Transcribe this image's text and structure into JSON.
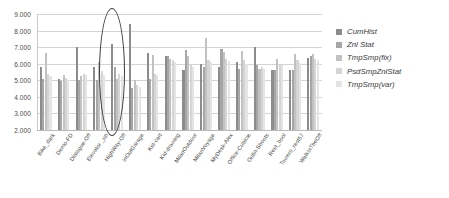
{
  "chart_data": {
    "type": "bar",
    "title": "",
    "xlabel": "",
    "ylabel": "",
    "ylim": [
      2000,
      9000
    ],
    "ytick_labels": [
      "9.000",
      "8.000",
      "7.000",
      "6.000",
      "5.000",
      "4.000",
      "3.000",
      "2.000"
    ],
    "ytick_values": [
      9000,
      8000,
      7000,
      6000,
      5000,
      4000,
      3000,
      2000
    ],
    "grid": true,
    "legend_position": "right",
    "categories": [
      "Bike_dark",
      "Demo-FD",
      "Dialogue-Off",
      "Elevator _up",
      "HighWay-Off",
      "InOutGarage",
      "Kid-cart",
      "Kid-drawing",
      "MilanOutdoor",
      "MilanVoyage",
      "MyDesk-Alex",
      "Office-Cubicle",
      "Outin-Shoots",
      "Rest_bool",
      "Towers_rest57",
      "WalkInTheOff"
    ],
    "series": [
      {
        "name": "CumHist",
        "color": "#8c8c8c",
        "values": [
          5800,
          5050,
          7000,
          5780,
          7200,
          8400,
          6620,
          6450,
          5600,
          6000,
          5800,
          6100,
          7020,
          5650,
          5620,
          6350
        ]
      },
      {
        "name": "Znl Stat",
        "color": "#a6a6a6",
        "values": [
          5050,
          4950,
          5000,
          5020,
          5780,
          4550,
          5100,
          6480,
          6850,
          5820,
          6900,
          5700,
          5950,
          5600,
          5600,
          6450
        ]
      },
      {
        "name": "TmpSmp(fix)",
        "color": "#c2c2c2",
        "values": [
          6620,
          5300,
          5250,
          6100,
          5100,
          5020,
          6550,
          6300,
          6450,
          7530,
          6700,
          6750,
          5700,
          6300,
          6600,
          6600
        ]
      },
      {
        "name": "PsdSmpZnlStat",
        "color": "#d5d5d5",
        "values": [
          5400,
          5150,
          5400,
          5550,
          5400,
          4700,
          5400,
          6200,
          5900,
          6200,
          6300,
          6200,
          5800,
          6000,
          6200,
          6300
        ]
      },
      {
        "name": "TmpSmp(var)",
        "color": "#e4e4e4",
        "values": [
          5250,
          5000,
          5300,
          5300,
          5250,
          4600,
          5300,
          6100,
          5800,
          6100,
          6150,
          6000,
          5700,
          5900,
          6050,
          6200
        ]
      }
    ],
    "highlight": {
      "category": "Elevator _up",
      "shape": "ellipse"
    }
  },
  "legend": {
    "items": [
      {
        "label": "CumHist",
        "color": "#8c8c8c"
      },
      {
        "label": "Znl Stat",
        "color": "#a6a6a6"
      },
      {
        "label": "TmpSmp(fix)",
        "color": "#c2c2c2"
      },
      {
        "label": "PsdSmpZnlStat",
        "color": "#d5d5d5"
      },
      {
        "label": "TmpSmp(var)",
        "color": "#e4e4e4"
      }
    ]
  }
}
